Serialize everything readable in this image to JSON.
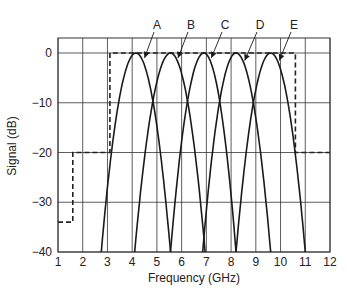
{
  "chart_data": {
    "type": "line",
    "title": "",
    "xlabel": "Frequency (GHz)",
    "ylabel": "Signal (dB)",
    "xlim": [
      1,
      12
    ],
    "ylim": [
      -40,
      3
    ],
    "xticks": [
      1,
      2,
      3,
      4,
      5,
      6,
      7,
      8,
      9,
      10,
      11,
      12
    ],
    "yticks": [
      0,
      -10,
      -20,
      -30,
      -40
    ],
    "ytick_labels": [
      "0",
      "−10",
      "−20",
      "−30",
      "−40"
    ],
    "grid": true,
    "legend": "none",
    "series": [
      {
        "name": "A",
        "style": "solid",
        "peak_x": 4.15,
        "peak_db": 0,
        "x_at_minus40": [
          2.75,
          5.55
        ]
      },
      {
        "name": "B",
        "style": "solid",
        "peak_x": 5.55,
        "peak_db": 0,
        "x_at_minus40": [
          4.1,
          6.95
        ]
      },
      {
        "name": "C",
        "style": "solid",
        "peak_x": 6.9,
        "peak_db": 0,
        "x_at_minus40": [
          5.55,
          8.2
        ]
      },
      {
        "name": "D",
        "style": "solid",
        "peak_x": 8.2,
        "peak_db": 0,
        "x_at_minus40": [
          6.85,
          9.6
        ]
      },
      {
        "name": "E",
        "style": "solid",
        "peak_x": 9.6,
        "peak_db": 0,
        "x_at_minus40": [
          8.2,
          11.0
        ]
      },
      {
        "name": "Spectral mask",
        "style": "dashed",
        "x": [
          1.0,
          1.6,
          1.6,
          3.1,
          3.1,
          10.6,
          10.6,
          12.0
        ],
        "y": [
          -34,
          -34,
          -20,
          -20,
          0,
          0,
          -20,
          -20
        ]
      }
    ],
    "annotations": [
      {
        "text": "A",
        "label_x_px": 157,
        "label_y_px": 25,
        "arrow_to_x": 4.5,
        "arrow_to_db": -1
      },
      {
        "text": "B",
        "label_x_px": 191,
        "label_y_px": 25,
        "arrow_to_x": 5.85,
        "arrow_to_db": -1
      },
      {
        "text": "C",
        "label_x_px": 225,
        "label_y_px": 25,
        "arrow_to_x": 7.2,
        "arrow_to_db": -1
      },
      {
        "text": "D",
        "label_x_px": 260,
        "label_y_px": 25,
        "arrow_to_x": 8.55,
        "arrow_to_db": -1.5
      },
      {
        "text": "E",
        "label_x_px": 294,
        "label_y_px": 25,
        "arrow_to_x": 9.95,
        "arrow_to_db": -1.5
      }
    ]
  },
  "colors": {
    "curve": "#1a1a1a",
    "grid": "#333333",
    "mask": "#222222",
    "text": "#222222"
  }
}
